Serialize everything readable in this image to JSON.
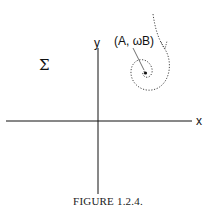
{
  "figure": {
    "caption": "FIGURE 1.2.4.",
    "x_axis_label": "x",
    "y_axis_label": "y",
    "region_label": "Σ",
    "point_label": "(A, ωB)"
  },
  "elements": {
    "axes": "horizontal x-axis and vertical y-axis crossing near center",
    "trajectory": "dotted spiral curve entering from top right, circling inward to a fixed point",
    "fixed_point": "solid dot at (A, ωB)"
  }
}
